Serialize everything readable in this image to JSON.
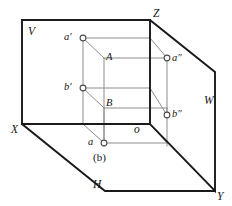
{
  "figure": {
    "caption": "(b)",
    "caption_letter": "b",
    "type": "descriptive-geometry-three-plane-projection",
    "stroke_colors": {
      "plane_edge": "#1a1a1a",
      "construction_line": "#8a8a8a",
      "vertex_fill": "#ffffff",
      "vertex_stroke": "#4d4d4d",
      "text": "#151515"
    },
    "planes": [
      {
        "id": "V",
        "label": "V",
        "name": "frontal-plane",
        "label_x": 28,
        "label_y": 26
      },
      {
        "id": "H",
        "label": "H",
        "name": "horizontal-plane",
        "label_x": 93,
        "label_y": 179
      },
      {
        "id": "W",
        "label": "W",
        "name": "profile-plane",
        "label_x": 204,
        "label_y": 95
      }
    ],
    "axes": [
      {
        "id": "X",
        "label": "X",
        "name": "x-axis",
        "label_x": 11,
        "label_y": 124
      },
      {
        "id": "Y",
        "label": "Y",
        "name": "y-axis",
        "label_x": 217,
        "label_y": 191
      },
      {
        "id": "Z",
        "label": "Z",
        "name": "z-axis",
        "label_x": 153,
        "label_y": 8
      },
      {
        "id": "o",
        "label": "o",
        "name": "origin",
        "label_x": 134,
        "label_y": 124
      }
    ],
    "points": [
      {
        "id": "a-prime",
        "label": "a'",
        "name": "point-a-prime-frontal-projection",
        "cx": 83,
        "cy": 38,
        "label_x": 64,
        "label_y": 32
      },
      {
        "id": "b-prime",
        "label": "b'",
        "name": "point-b-prime-frontal-projection",
        "cx": 83,
        "cy": 88,
        "label_x": 64,
        "label_y": 82
      },
      {
        "id": "a-double-prime",
        "label": "a\"",
        "name": "point-a-double-prime-profile-projection",
        "cx": 167,
        "cy": 58,
        "label_x": 172,
        "label_y": 58
      },
      {
        "id": "b-double-prime",
        "label": "b\"",
        "name": "point-b-double-prime-profile-projection",
        "cx": 167,
        "cy": 115,
        "label_x": 172,
        "label_y": 114
      },
      {
        "id": "a",
        "label": "a",
        "name": "point-a-horizontal-projection",
        "cx": 104,
        "cy": 143,
        "label_x": 88,
        "label_y": 139
      }
    ],
    "space_points": [
      {
        "id": "A",
        "label": "A",
        "name": "space-point-A",
        "label_x": 106,
        "label_y": 55
      },
      {
        "id": "B",
        "label": "B",
        "name": "space-point-B",
        "label_x": 106,
        "label_y": 101
      }
    ]
  }
}
